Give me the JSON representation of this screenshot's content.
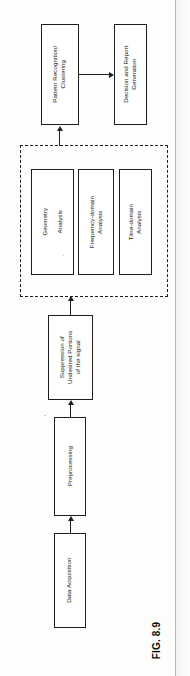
{
  "figure": {
    "caption": "FIG. 8.9",
    "orientation": "rotated-90-ccw",
    "page_background": "#fdfdfc",
    "ink_color": "#1d1d1d"
  },
  "diagram": {
    "type": "flowchart",
    "nodes": [
      {
        "id": "data-acquisition",
        "label": "Data Acquisition"
      },
      {
        "id": "preprocessing",
        "label": "Preprocessing"
      },
      {
        "id": "suppression",
        "label": "Suppression of\nUndesired Portions\nof the signal"
      },
      {
        "id": "time-domain-analysis",
        "label": "Time-domain\nAnalysis"
      },
      {
        "id": "frequency-domain-analysis",
        "label": "Frequency-domain\nAnalysis"
      },
      {
        "id": "geometry-analysis",
        "label": "Geometry\n\nAnalysis"
      },
      {
        "id": "pattern-recognition",
        "label": "Pattern Recognition/\nClustering"
      },
      {
        "id": "decision-report",
        "label": "Decision and Report\nGeneration"
      }
    ],
    "group": {
      "id": "analysis-group",
      "style": "dashed",
      "members": [
        "time-domain-analysis",
        "frequency-domain-analysis",
        "geometry-analysis"
      ]
    },
    "edges": [
      {
        "from": "data-acquisition",
        "to": "preprocessing"
      },
      {
        "from": "preprocessing",
        "to": "suppression"
      },
      {
        "from": "suppression",
        "to": "analysis-group"
      },
      {
        "from": "analysis-group",
        "to": "pattern-recognition"
      },
      {
        "from": "pattern-recognition",
        "to": "decision-report"
      }
    ]
  },
  "labels": {
    "data_acquisition": "Data Acquisition",
    "preprocessing": "Preprocessing",
    "suppression_l1": "Suppression of",
    "suppression_l2": "Undesired Portions",
    "suppression_l3": "of the signal",
    "time_domain_l1": "Time-domain",
    "time_domain_l2": "Analysis",
    "frequency_domain_l1": "Frequency-domain",
    "frequency_domain_l2": "Analysis",
    "geometry_l1": "Geometry",
    "geometry_l2": "Analysis",
    "pattern_l1": "Pattern Recognition/",
    "pattern_l2": "Clustering",
    "decision_l1": "Decision and Report",
    "decision_l2": "Generation"
  }
}
